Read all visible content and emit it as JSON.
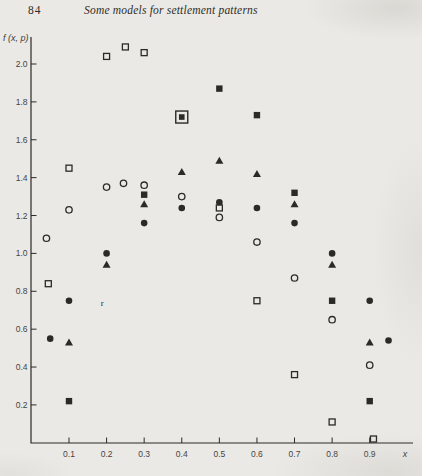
{
  "header": {
    "page_number": "84",
    "title": "Some models for settlement patterns"
  },
  "colors": {
    "ink": "#2a2a26",
    "tick_text": "#45443f",
    "paper": "#ebe9e5"
  },
  "chart_data": {
    "type": "scatter",
    "title": "",
    "xlabel": "x",
    "ylabel": "f (x, p)",
    "xlim": [
      0,
      1.02
    ],
    "ylim": [
      0,
      2.15
    ],
    "grid": false,
    "legend": "none",
    "x_ticks": [
      0.1,
      0.2,
      0.3,
      0.4,
      0.5,
      0.6,
      0.7,
      0.8,
      0.9
    ],
    "x_tick_labels": [
      "0.1",
      "0.2",
      "0.3",
      "0.4",
      "0.5",
      "0.6",
      "0.7",
      "0.8",
      "0.9"
    ],
    "y_ticks": [
      2.0,
      1.8,
      1.6,
      1.4,
      1.2,
      1.0,
      0.8,
      0.6,
      0.4,
      0.2
    ],
    "y_tick_labels": [
      "2.0",
      "1.8",
      "1.6",
      "1.4",
      "1.2",
      "1.0",
      "0.8",
      "0.6",
      "0.4",
      "0.2"
    ],
    "series": [
      {
        "name": "open-square-series",
        "marker": "square-open",
        "points": [
          [
            0.045,
            0.84
          ],
          [
            0.1,
            1.45
          ],
          [
            0.2,
            2.04
          ],
          [
            0.25,
            2.09
          ],
          [
            0.3,
            2.06
          ],
          [
            0.5,
            1.24
          ],
          [
            0.6,
            0.75
          ],
          [
            0.7,
            0.36
          ],
          [
            0.8,
            0.11
          ],
          [
            0.91,
            0.02
          ]
        ]
      },
      {
        "name": "filled-square-series",
        "marker": "square-filled",
        "points": [
          [
            0.1,
            0.22
          ],
          [
            0.3,
            1.31
          ],
          [
            0.5,
            1.87
          ],
          [
            0.6,
            1.73
          ],
          [
            0.7,
            1.32
          ],
          [
            0.8,
            0.75
          ],
          [
            0.9,
            0.22
          ]
        ]
      },
      {
        "name": "open-circle-series",
        "marker": "circle-open",
        "points": [
          [
            0.04,
            1.08
          ],
          [
            0.1,
            1.23
          ],
          [
            0.2,
            1.35
          ],
          [
            0.245,
            1.37
          ],
          [
            0.3,
            1.36
          ],
          [
            0.4,
            1.3
          ],
          [
            0.5,
            1.19
          ],
          [
            0.6,
            1.06
          ],
          [
            0.7,
            0.87
          ],
          [
            0.8,
            0.65
          ],
          [
            0.9,
            0.41
          ]
        ]
      },
      {
        "name": "filled-circle-series",
        "marker": "circle-filled",
        "points": [
          [
            0.05,
            0.55
          ],
          [
            0.1,
            0.75
          ],
          [
            0.2,
            1.0
          ],
          [
            0.3,
            1.16
          ],
          [
            0.4,
            1.24
          ],
          [
            0.5,
            1.27
          ],
          [
            0.6,
            1.24
          ],
          [
            0.7,
            1.16
          ],
          [
            0.8,
            1.0
          ],
          [
            0.9,
            0.75
          ],
          [
            0.95,
            0.54
          ]
        ]
      },
      {
        "name": "filled-triangle-series",
        "marker": "triangle-filled",
        "points": [
          [
            0.1,
            0.53
          ],
          [
            0.2,
            0.94
          ],
          [
            0.3,
            1.26
          ],
          [
            0.4,
            1.43
          ],
          [
            0.5,
            1.49
          ],
          [
            0.6,
            1.42
          ],
          [
            0.7,
            1.26
          ],
          [
            0.8,
            0.94
          ],
          [
            0.9,
            0.53
          ]
        ]
      },
      {
        "name": "square-in-square-overlap-point",
        "marker": "square-in-square",
        "points": [
          [
            0.4,
            1.72
          ]
        ]
      },
      {
        "name": "print-defect-r-mark",
        "marker": "r-glyph",
        "glyph": "r",
        "points": [
          [
            0.19,
            0.74
          ]
        ]
      }
    ]
  }
}
